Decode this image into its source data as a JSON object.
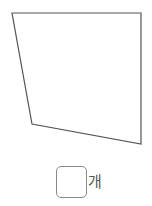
{
  "figure": {
    "shape": "quadrilateral",
    "vertices": [
      [
        12,
        13
      ],
      [
        141,
        13
      ],
      [
        141,
        144
      ],
      [
        32,
        124
      ]
    ],
    "stroke": "#555555"
  },
  "answer": {
    "value": "",
    "unit": "개"
  }
}
